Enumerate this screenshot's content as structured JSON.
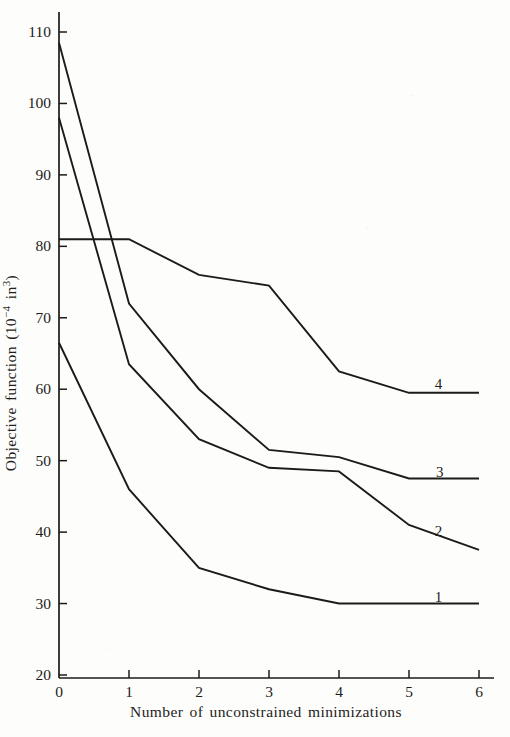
{
  "chart_data": {
    "type": "line",
    "title": "",
    "xlabel": "Number of unconstrained minimizations",
    "ylabel": "Objective function (10⁻⁴ in³)",
    "ylabel_parts": [
      {
        "text": "Objective function (10"
      },
      {
        "text": "−4",
        "sup": true
      },
      {
        "text": " in"
      },
      {
        "text": "3",
        "sup": true
      },
      {
        "text": ")"
      }
    ],
    "x": [
      0,
      1,
      2,
      3,
      4,
      5,
      6
    ],
    "xlim": [
      0,
      6
    ],
    "ylim": [
      20,
      110
    ],
    "x_ticks": [
      0,
      1,
      2,
      3,
      4,
      5,
      6
    ],
    "y_ticks": [
      20,
      30,
      40,
      50,
      60,
      70,
      80,
      90,
      100,
      110
    ],
    "grid": false,
    "legend_position": "inline-curve-labels",
    "ink_color": "#1c1b19",
    "paper_color": "#fdfdfb",
    "series": [
      {
        "name": "1",
        "values": [
          66.5,
          46,
          35,
          32,
          30,
          30,
          30
        ],
        "label": "1",
        "label_x": 5.42,
        "label_y": 30.9
      },
      {
        "name": "2",
        "values": [
          98,
          63.5,
          53,
          49,
          48.5,
          41,
          37.5
        ],
        "label": "2",
        "label_x": 5.42,
        "label_y": 40.2
      },
      {
        "name": "3",
        "values": [
          108.5,
          72,
          60,
          51.5,
          50.5,
          47.5,
          47.5
        ],
        "label": "3",
        "label_x": 5.44,
        "label_y": 48.4
      },
      {
        "name": "4",
        "values": [
          81,
          81,
          76,
          74.5,
          62.5,
          59.5,
          59.5
        ],
        "label": "4",
        "label_x": 5.42,
        "label_y": 60.7
      }
    ]
  }
}
